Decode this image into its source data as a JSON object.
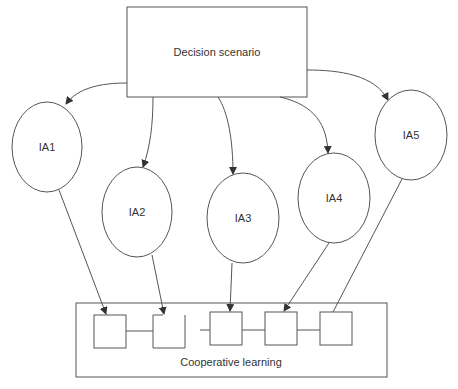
{
  "diagram": {
    "top_node": {
      "label": "Decision scenario"
    },
    "agents": [
      {
        "id": "IA1",
        "label": "IA1"
      },
      {
        "id": "IA2",
        "label": "IA2"
      },
      {
        "id": "IA3",
        "label": "IA3"
      },
      {
        "id": "IA4",
        "label": "IA4"
      },
      {
        "id": "IA5",
        "label": "IA5"
      }
    ],
    "bottom_node": {
      "label": "Cooperative learning",
      "slot_count": 5
    },
    "edges": [
      {
        "from": "Decision scenario",
        "to": "IA1",
        "arrow": true
      },
      {
        "from": "Decision scenario",
        "to": "IA2",
        "arrow": true
      },
      {
        "from": "Decision scenario",
        "to": "IA3",
        "arrow": true
      },
      {
        "from": "Decision scenario",
        "to": "IA4",
        "arrow": true
      },
      {
        "from": "Decision scenario",
        "to": "IA5",
        "arrow": true
      },
      {
        "from": "IA1",
        "to": "slot-1",
        "arrow": true
      },
      {
        "from": "IA2",
        "to": "slot-2",
        "arrow": true
      },
      {
        "from": "IA3",
        "to": "slot-3",
        "arrow": true
      },
      {
        "from": "IA4",
        "to": "slot-4",
        "arrow": true
      },
      {
        "from": "IA5",
        "to": "slot-5",
        "arrow": false
      }
    ],
    "colors": {
      "stroke": "#555555",
      "text": "#333333",
      "background": "#ffffff"
    }
  }
}
